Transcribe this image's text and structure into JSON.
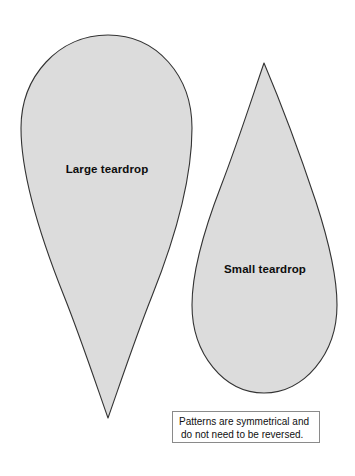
{
  "page": {
    "background_color": "#ffffff",
    "width": 355,
    "height": 476
  },
  "style": {
    "shape_fill": "#dcdcdc",
    "shape_stroke": "#333333",
    "note_border": "#8a8a8a",
    "text_color": "#0d0d0d"
  },
  "shapes": [
    {
      "name": "large-teardrop",
      "label": "Large teardrop",
      "orientation": "point-down",
      "bounds": {
        "x": 21,
        "y": 35,
        "width": 171,
        "height": 383
      },
      "tip": {
        "x": 108,
        "y": 418
      },
      "label_position": {
        "x": 107,
        "y": 169
      }
    },
    {
      "name": "small-teardrop",
      "label": "Small teardrop",
      "orientation": "point-up",
      "bounds": {
        "x": 192,
        "y": 63,
        "width": 145,
        "height": 330
      },
      "tip": {
        "x": 264,
        "y": 63
      },
      "label_position": {
        "x": 265,
        "y": 269
      }
    }
  ],
  "note": {
    "line1": "Patterns are symmetrical and",
    "line2": "do not need to be reversed.",
    "bounds": {
      "x": 172,
      "y": 411,
      "width": 148,
      "height": 32
    }
  }
}
